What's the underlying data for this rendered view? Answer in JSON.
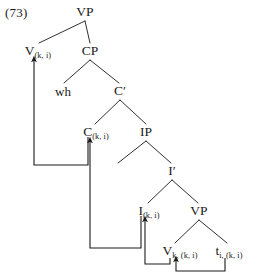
{
  "figure": {
    "example_number": "(73)",
    "type": "syntactic-tree",
    "ink_color": "#1a1a1a",
    "background_color": "#ffffff"
  },
  "nodes": [
    {
      "id": "vp-root",
      "label": "VP",
      "subscript": "",
      "x": 85,
      "y": 12
    },
    {
      "id": "v-top",
      "label": "V",
      "subscript": "(k, i)",
      "x": 38,
      "y": 51
    },
    {
      "id": "cp",
      "label": "CP",
      "subscript": "",
      "x": 90,
      "y": 51
    },
    {
      "id": "wh",
      "label": "wh",
      "subscript": "",
      "x": 63,
      "y": 91
    },
    {
      "id": "cbar",
      "label": "C′",
      "subscript": "",
      "x": 120,
      "y": 91
    },
    {
      "id": "c-head",
      "label": "C",
      "subscript": "(k, i)",
      "x": 96,
      "y": 132
    },
    {
      "id": "ip",
      "label": "IP",
      "subscript": "",
      "x": 146,
      "y": 132
    },
    {
      "id": "ibar",
      "label": "I′",
      "subscript": "",
      "x": 172,
      "y": 171
    },
    {
      "id": "i-head",
      "label": "I",
      "subscript": "(k, i)",
      "x": 149,
      "y": 211
    },
    {
      "id": "vp-lower",
      "label": "VP",
      "subscript": "",
      "x": 199,
      "y": 211
    },
    {
      "id": "v-bottom",
      "label": "V",
      "subscript": "k, (k, i)",
      "x": 180,
      "y": 251
    },
    {
      "id": "trace",
      "label": "t",
      "subscript": "i, (k, i)",
      "x": 229,
      "y": 251
    }
  ],
  "branches": [
    {
      "name": "vp-root-to-v-top",
      "x1": 85,
      "y1": 21,
      "x2": 39,
      "y2": 43
    },
    {
      "name": "vp-root-to-cp",
      "x1": 85,
      "y1": 21,
      "x2": 90,
      "y2": 43
    },
    {
      "name": "cp-to-wh",
      "x1": 90,
      "y1": 60,
      "x2": 64,
      "y2": 83
    },
    {
      "name": "cp-to-cbar",
      "x1": 90,
      "y1": 60,
      "x2": 119,
      "y2": 83
    },
    {
      "name": "cbar-to-c-head",
      "x1": 120,
      "y1": 100,
      "x2": 95,
      "y2": 124
    },
    {
      "name": "cbar-to-ip",
      "x1": 120,
      "y1": 100,
      "x2": 146,
      "y2": 124
    },
    {
      "name": "ip-to-spec",
      "x1": 146,
      "y1": 141,
      "x2": 118,
      "y2": 163
    },
    {
      "name": "ip-to-ibar",
      "x1": 146,
      "y1": 141,
      "x2": 171,
      "y2": 163
    },
    {
      "name": "ibar-to-i-head",
      "x1": 172,
      "y1": 180,
      "x2": 148,
      "y2": 203
    },
    {
      "name": "ibar-to-vp-lower",
      "x1": 172,
      "y1": 180,
      "x2": 198,
      "y2": 203
    },
    {
      "name": "vp-lower-to-v",
      "x1": 199,
      "y1": 220,
      "x2": 175,
      "y2": 243
    },
    {
      "name": "vp-lower-to-trace",
      "x1": 199,
      "y1": 220,
      "x2": 227,
      "y2": 243
    }
  ],
  "movement_arrows": [
    {
      "name": "trace-to-v-movement",
      "from_node": "trace",
      "to_node": "v-bottom",
      "path": "M 225,258 L 225,271 L 176,271 L 176,259"
    },
    {
      "name": "v-to-i-movement",
      "from_node": "v-bottom",
      "to_node": "i-head",
      "path": "M 170,258 L 170,264 L 145,264 L 145,219"
    },
    {
      "name": "i-to-c-movement",
      "from_node": "i-head",
      "to_node": "c-head",
      "path": "M 141,216 L 141,248 L 90,248 L 90,140"
    },
    {
      "name": "c-to-v-movement",
      "from_node": "c-head",
      "to_node": "v-top",
      "path": "M 88,137 L 88,165 L 34,165 L 34,59"
    }
  ]
}
